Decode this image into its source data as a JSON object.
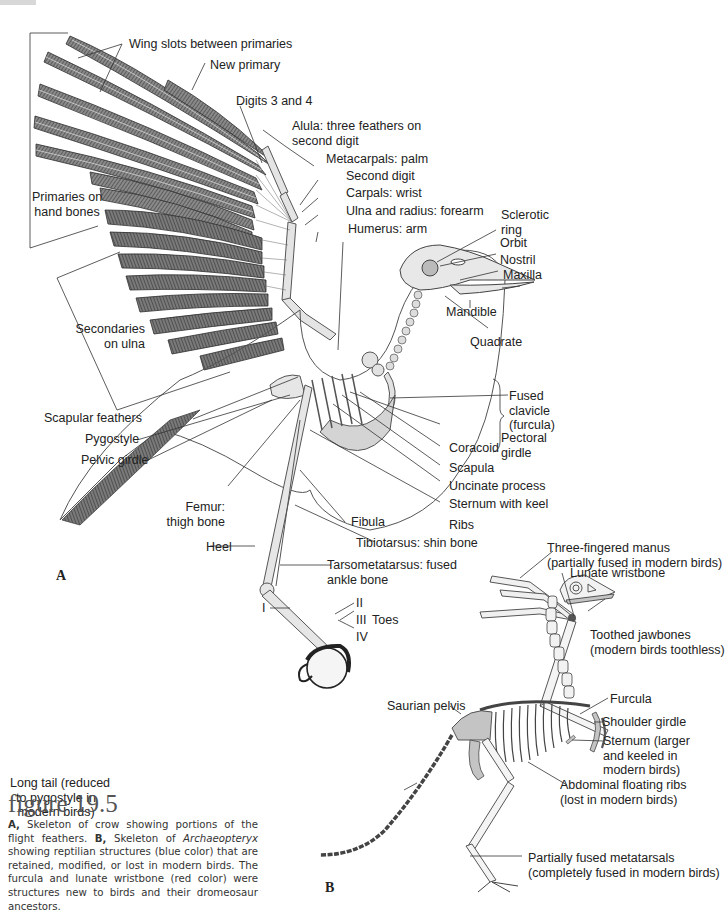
{
  "figure": {
    "title": "figure 19.5",
    "caption": {
      "a_marker": "A,",
      "a_text": " Skeleton of crow showing portions of the flight feathers. ",
      "b_marker": "B,",
      "b_text_1": " Skeleton of ",
      "b_genus": "Archaeopteryx",
      "b_text_2": " showing reptilian structures (blue color) that are retained, modified, or lost in modern birds. The furcula and lunate wristbone (red color) were structures new to birds and their dromeosaur ancestors."
    }
  },
  "panel_a": {
    "marker": "A",
    "labels": {
      "wing_slots": "Wing slots between primaries",
      "new_primary": "New primary",
      "digits_3_4": "Digits 3 and 4",
      "alula_1": "Alula: three feathers on",
      "alula_2": "second digit",
      "metacarpals": "Metacarpals: palm",
      "second_digit": "Second digit",
      "carpals": "Carpals: wrist",
      "ulna_radius": "Ulna and radius: forearm",
      "humerus": "Humerus:  arm",
      "primaries_1": "Primaries on",
      "primaries_2": "hand bones",
      "sclerotic_1": "Sclerotic",
      "sclerotic_2": "ring",
      "orbit": "Orbit",
      "nostril": "Nostril",
      "maxilla": "Maxilla",
      "mandible": "Mandible",
      "quadrate": "Quadrate",
      "secondaries_1": "Secondaries",
      "secondaries_2": "on ulna",
      "scapular_feathers": "Scapular feathers",
      "pygostyle": "Pygostyle",
      "pelvic_girdle": "Pelvic girdle",
      "fused_clavicle_1": "Fused",
      "fused_clavicle_2": "clavicle",
      "fused_clavicle_3": "(furcula)",
      "coracoid": "Coracoid",
      "scapula": "Scapula",
      "pectoral_1": "Pectoral",
      "pectoral_2": "girdle",
      "uncinate": "Uncinate process",
      "sternum_keel": "Sternum with keel",
      "ribs": "Ribs",
      "femur_1": "Femur:",
      "femur_2": "thigh bone",
      "fibula": "Fibula",
      "heel": "Heel",
      "tibiotarsus": "Tibiotarsus: shin bone",
      "tarsometatarsus_1": "Tarsometatarsus: fused",
      "tarsometatarsus_2": "ankle bone",
      "toe_i": "I",
      "toe_ii": "II",
      "toe_iii": "III",
      "toe_iv": "IV",
      "toes": "Toes"
    }
  },
  "panel_b": {
    "marker": "B",
    "labels": {
      "manus_1": "Three-fingered manus",
      "manus_2": "(partially fused in modern birds)",
      "lunate": "Lunate wristbone",
      "jaw_1": "Toothed jawbones",
      "jaw_2": "(modern birds toothless)",
      "saurian_pelvis": "Saurian pelvis",
      "furcula": "Furcula",
      "shoulder_girdle": "Shoulder girdle",
      "sternum_1": "Sternum (larger",
      "sternum_2": "and keeled in",
      "sternum_3": "modern birds)",
      "tail_1": "Long tail (reduced",
      "tail_2": "to pygostyle in",
      "tail_3": "modern birds)",
      "floating_ribs_1": "Abdominal floating ribs",
      "floating_ribs_2": "(lost in modern birds)",
      "metatarsals_1": "Partially fused metatarsals",
      "metatarsals_2": "(completely fused in modern birds)"
    }
  },
  "colors": {
    "feather": "#6b6b6b",
    "bone": "#e6e6e6",
    "bone_outline": "#555555",
    "reptilian_blue": "#c4c4c4",
    "bird_red": "#555555",
    "leader": "#333333"
  }
}
